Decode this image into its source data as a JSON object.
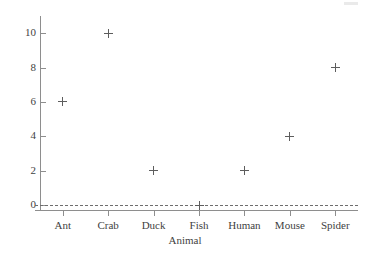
{
  "chart_data": {
    "type": "scatter",
    "title": "",
    "xlabel": "Animal",
    "ylabel": "Number of legs",
    "categories": [
      "Ant",
      "Crab",
      "Duck",
      "Fish",
      "Human",
      "Mouse",
      "Spider"
    ],
    "values": [
      6,
      10,
      2,
      0,
      2,
      4,
      8
    ],
    "points": [
      {
        "x": "Ant",
        "y": 6
      },
      {
        "x": "Crab",
        "y": 10
      },
      {
        "x": "Duck",
        "y": 2
      },
      {
        "x": "Fish",
        "y": 0
      },
      {
        "x": "Human",
        "y": 2
      },
      {
        "x": "Mouse",
        "y": 4
      },
      {
        "x": "Spider",
        "y": 8
      }
    ],
    "ylim": [
      0,
      11
    ],
    "yticks": [
      0,
      2,
      4,
      6,
      8,
      10
    ],
    "ytick_labels": [
      "0",
      "2",
      "4",
      "6",
      "8",
      "10"
    ],
    "grid": false,
    "legend": null,
    "marker": "plus",
    "annotations": [
      {
        "type": "reference-line",
        "axis": "y",
        "value": 0,
        "style": "dashed"
      }
    ],
    "colors": {
      "marker": "#5d5d5d",
      "axis": "#8e8e8e",
      "text": "#3f3f3f",
      "reference_line": "#6d6d6d",
      "background": "#ffffff"
    }
  }
}
